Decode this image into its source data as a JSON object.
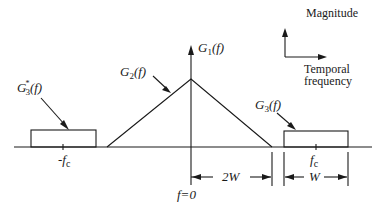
{
  "figure": {
    "legend": {
      "vertical_label": "Magnitude",
      "horizontal_label_line1": "Temporal",
      "horizontal_label_line2": "frequency"
    },
    "curves": {
      "g1_label": "G",
      "g1_sub": "1",
      "g1_arg": "(f)",
      "g2_label": "G",
      "g2_sub": "2",
      "g2_arg": "(f)",
      "g3_label": "G",
      "g3_sub": "3",
      "g3_arg": "(f)",
      "g3conj_label": "G",
      "g3conj_sup": "*",
      "g3conj_sub": "3",
      "g3conj_arg": "(f)"
    },
    "axis": {
      "origin_label": "f=0",
      "neg_carrier_label": "-f",
      "neg_carrier_sub": "c",
      "pos_carrier_label": "f",
      "pos_carrier_sub": "c"
    },
    "dimensions": {
      "baseband_width": "2W",
      "bandpass_width": "W"
    }
  }
}
